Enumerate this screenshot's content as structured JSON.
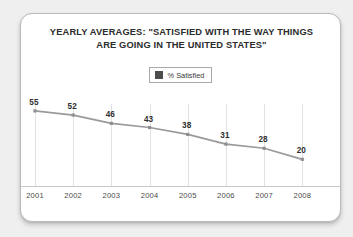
{
  "card": {
    "title_line_1": "YEARLY AVERAGES: \"SATISFIED WITH THE WAY THINGS",
    "title_line_2": "ARE GOING IN THE UNITED STATES\""
  },
  "legend": {
    "series_label": "% Satisfied",
    "swatch_color": "#4d4d4d",
    "swatch_icon": "square-swatch-icon"
  },
  "colors": {
    "line": "#9a9a9c",
    "marker": "#8f8f91",
    "gridline": "#e2e2e4",
    "axis": "#c9c9cb",
    "label_text": "#2f2f2f",
    "title_text": "#2c2c2c",
    "card_background": "#ffffff",
    "page_background": "#efeff0"
  },
  "chart_data": {
    "type": "line",
    "title": "YEARLY AVERAGES: \"SATISFIED WITH THE WAY THINGS ARE GOING IN THE UNITED STATES\"",
    "xlabel": "",
    "ylabel": "",
    "categories": [
      "2001",
      "2002",
      "2003",
      "2004",
      "2005",
      "2006",
      "2007",
      "2008"
    ],
    "series": [
      {
        "name": "% Satisfied",
        "values": [
          55,
          52,
          46,
          43,
          38,
          31,
          28,
          20
        ]
      }
    ],
    "point_labels": [
      "55",
      "52",
      "46",
      "43",
      "38",
      "31",
      "28",
      "20"
    ],
    "ylim": [
      0,
      60
    ],
    "grid": "vertical-only",
    "legend_position": "top-center",
    "markers": true,
    "axis_visible": "bottom-only"
  }
}
